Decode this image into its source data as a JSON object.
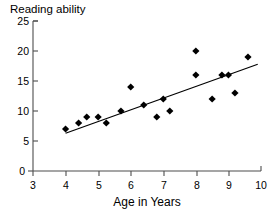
{
  "chart_data": {
    "type": "scatter",
    "title": "Reading ability",
    "xlabel": "Age in Years",
    "ylabel": "Reading ability",
    "xlim": [
      3,
      10
    ],
    "ylim": [
      0,
      25
    ],
    "xticks": [
      3,
      4,
      5,
      6,
      7,
      8,
      9,
      10
    ],
    "yticks": [
      0,
      5,
      10,
      15,
      20,
      25
    ],
    "xtick_labels": [
      "3",
      "4",
      "5",
      "6",
      "7",
      "8",
      "9",
      "10"
    ],
    "ytick_labels": [
      "0",
      "5",
      "10",
      "15",
      "20",
      "25"
    ],
    "grid": false,
    "legend": false,
    "marker": "diamond",
    "marker_color": "#000000",
    "points": [
      {
        "x": 4.0,
        "y": 7
      },
      {
        "x": 4.4,
        "y": 8
      },
      {
        "x": 4.65,
        "y": 9
      },
      {
        "x": 5.0,
        "y": 9
      },
      {
        "x": 5.25,
        "y": 8
      },
      {
        "x": 5.7,
        "y": 10
      },
      {
        "x": 6.0,
        "y": 14
      },
      {
        "x": 6.4,
        "y": 11
      },
      {
        "x": 6.8,
        "y": 9
      },
      {
        "x": 7.0,
        "y": 12
      },
      {
        "x": 7.2,
        "y": 10
      },
      {
        "x": 8.0,
        "y": 20
      },
      {
        "x": 8.0,
        "y": 16
      },
      {
        "x": 8.5,
        "y": 12
      },
      {
        "x": 8.8,
        "y": 16
      },
      {
        "x": 9.0,
        "y": 16
      },
      {
        "x": 9.2,
        "y": 13
      },
      {
        "x": 9.6,
        "y": 19
      }
    ],
    "trendline": {
      "type": "linear",
      "color": "#000000",
      "x_start": 4.0,
      "y_start": 6.3,
      "x_end": 9.9,
      "y_end": 17.8
    }
  }
}
